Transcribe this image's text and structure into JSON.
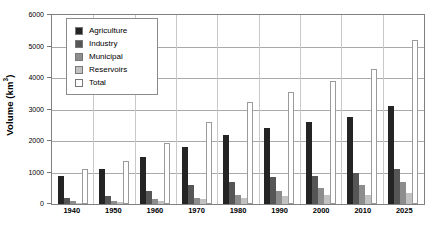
{
  "chart_data": {
    "type": "bar",
    "title": "",
    "subtitle": "",
    "xlabel": "",
    "ylabel": "Volume (km³)",
    "ylabel_base": "Volume (km",
    "ylabel_sup": "3",
    "ylabel_close": ")",
    "ylim": [
      0,
      6000
    ],
    "ytick_values": [
      0,
      1000,
      2000,
      3000,
      4000,
      5000,
      6000
    ],
    "ytick_labels": [
      "0",
      "1000",
      "2000",
      "3000",
      "4000",
      "5000",
      "6000"
    ],
    "grid": true,
    "grid_axis": "y",
    "legend_position": "upper-left-inside",
    "categories": [
      "1940",
      "1950",
      "1960",
      "1970",
      "1980",
      "1990",
      "2000",
      "2010",
      "2025"
    ],
    "series": [
      {
        "name": "Agriculture",
        "color": "#242424",
        "values": [
          900,
          1100,
          1500,
          1800,
          2200,
          2400,
          2600,
          2750,
          3100
        ]
      },
      {
        "name": "Industry",
        "color": "#565656",
        "values": [
          200,
          250,
          400,
          600,
          700,
          850,
          900,
          1000,
          1100
        ]
      },
      {
        "name": "Municipal",
        "color": "#8d8d8d",
        "values": [
          80,
          100,
          150,
          200,
          300,
          400,
          500,
          600,
          700
        ]
      },
      {
        "name": "Reservoirs",
        "color": "#c2c2c2",
        "values": [
          20,
          50,
          80,
          150,
          200,
          250,
          280,
          300,
          350
        ]
      },
      {
        "name": "Total",
        "color": "#ffffff",
        "values": [
          1100,
          1350,
          1950,
          2600,
          3250,
          3550,
          3900,
          4300,
          5200
        ]
      }
    ]
  }
}
